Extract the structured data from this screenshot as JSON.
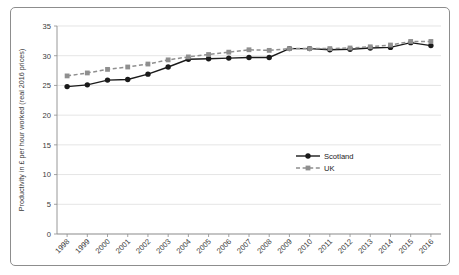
{
  "chart_data": {
    "type": "line",
    "title": "",
    "xlabel": "",
    "ylabel": "Productivity in £ per hour worked (real 2016 prices)",
    "ylim": [
      0,
      35
    ],
    "yticks": [
      0,
      5,
      10,
      15,
      20,
      25,
      30,
      35
    ],
    "grid": true,
    "legend_position": "center-right",
    "categories": [
      "1998",
      "1999",
      "2000",
      "2001",
      "2002",
      "2003",
      "2004",
      "2005",
      "2006",
      "2007",
      "2008",
      "2009",
      "2010",
      "2011",
      "2012",
      "2013",
      "2014",
      "2015",
      "2016"
    ],
    "series": [
      {
        "name": "Scotland",
        "color": "#1a1a1a",
        "marker": "circle",
        "linestyle": "solid",
        "values": [
          24.8,
          25.1,
          25.9,
          26.0,
          26.9,
          28.1,
          29.4,
          29.5,
          29.6,
          29.7,
          29.7,
          31.2,
          31.2,
          31.0,
          31.1,
          31.3,
          31.4,
          32.2,
          31.7
        ]
      },
      {
        "name": "UK",
        "color": "#8f8f8f",
        "marker": "square",
        "linestyle": "dashed",
        "values": [
          26.6,
          27.1,
          27.7,
          28.1,
          28.6,
          29.3,
          29.8,
          30.2,
          30.6,
          31.0,
          30.9,
          31.2,
          31.2,
          31.2,
          31.3,
          31.5,
          31.8,
          32.4,
          32.4
        ]
      }
    ]
  },
  "legend": {
    "items": [
      {
        "label": "Scotland"
      },
      {
        "label": "UK"
      }
    ]
  },
  "colors": {
    "scotland": "#1a1a1a",
    "uk": "#8f8f8f",
    "grid": "#d9d9d9",
    "axis": "#8d8d8d",
    "frame": "#8d8d8d",
    "background": "#ffffff"
  }
}
